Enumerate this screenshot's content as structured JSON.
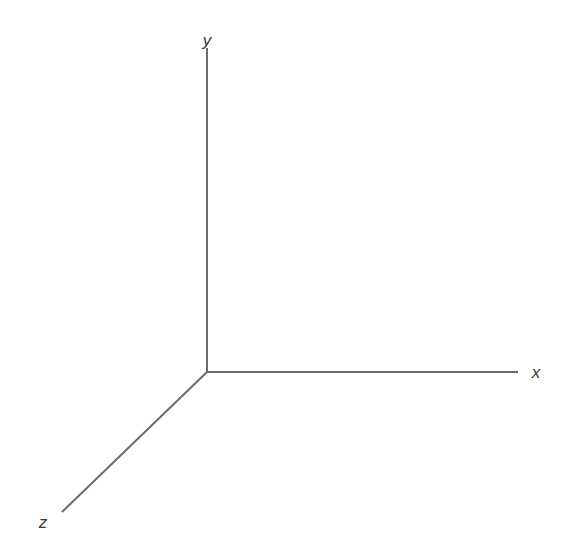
{
  "figure": {
    "name": "3d-coordinate-axes",
    "width": 576,
    "height": 552,
    "background_color": "#ffffff",
    "axis_color": "#6b6b6b",
    "axis_stroke_width": 2,
    "label_color": "#3a3a3a",
    "label_font_size": 17,
    "label_font_style": "italic"
  },
  "chart_data": {
    "type": "diagram",
    "title": "",
    "subtitle": "",
    "xlabel": "",
    "ylabel": "",
    "grid": false,
    "legend": false,
    "origin": {
      "x": 207,
      "y": 372
    },
    "axes": [
      {
        "name": "y",
        "label": "y",
        "direction": "up",
        "start": {
          "x": 207,
          "y": 372
        },
        "end": {
          "x": 207,
          "y": 48
        },
        "length_px": 324,
        "angle_deg": 90,
        "label_position": {
          "x": 207,
          "y": 40
        }
      },
      {
        "name": "x",
        "label": "x",
        "direction": "right",
        "start": {
          "x": 207,
          "y": 372
        },
        "end": {
          "x": 518,
          "y": 372
        },
        "length_px": 311,
        "angle_deg": 0,
        "label_position": {
          "x": 536,
          "y": 372
        }
      },
      {
        "name": "z",
        "label": "z",
        "direction": "down-left",
        "start": {
          "x": 207,
          "y": 372
        },
        "end": {
          "x": 62,
          "y": 512
        },
        "length_px": 201,
        "angle_deg": 224,
        "label_position": {
          "x": 43,
          "y": 522
        }
      }
    ]
  }
}
